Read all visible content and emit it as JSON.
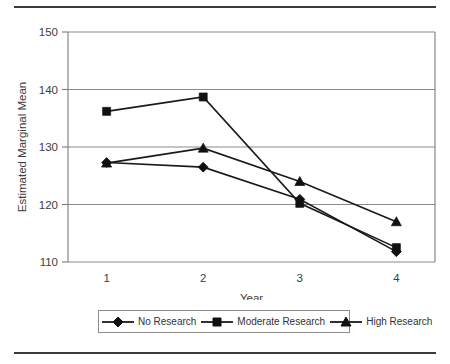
{
  "figure": {
    "has_top_rule": true,
    "has_bottom_rule": true,
    "line_color": "#3b3b3b"
  },
  "axes": {
    "y_title": "Estimated Marginal Mean",
    "x_title": "Year",
    "y_ticks": [
      "150",
      "140",
      "130",
      "120",
      "110"
    ],
    "x_ticks": [
      "1",
      "2",
      "3",
      "4"
    ]
  },
  "legend": {
    "entries": [
      {
        "label": "No Research",
        "marker": "diamond-marker"
      },
      {
        "label": "Moderate Research",
        "marker": "square-marker"
      },
      {
        "label": "High Research",
        "marker": "triangle-marker"
      }
    ]
  },
  "chart_data": {
    "type": "line",
    "title": "",
    "xlabel": "Year",
    "ylabel": "Estimated Marginal Mean",
    "categories": [
      "1",
      "2",
      "3",
      "4"
    ],
    "x": [
      1,
      2,
      3,
      4
    ],
    "xlim": [
      0.6,
      4.4
    ],
    "ylim": [
      110,
      150
    ],
    "y_ticks": [
      110,
      120,
      130,
      140,
      150
    ],
    "grid": "horizontal",
    "legend_position": "bottom",
    "marker_color": "#111111",
    "line_color": "#1a1a1a",
    "series": [
      {
        "name": "No Research",
        "marker": "diamond",
        "values": [
          127.3,
          126.5,
          120.9,
          111.8
        ]
      },
      {
        "name": "Moderate Research",
        "marker": "square",
        "values": [
          136.2,
          138.7,
          120.2,
          112.5
        ]
      },
      {
        "name": "High Research",
        "marker": "triangle",
        "values": [
          127.2,
          129.8,
          124.0,
          117.0
        ]
      }
    ]
  }
}
